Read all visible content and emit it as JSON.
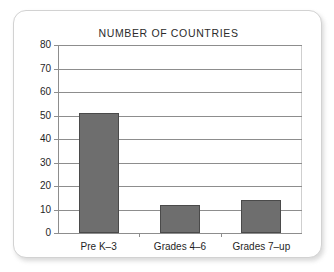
{
  "chart_data": {
    "type": "bar",
    "title": "NUMBER OF COUNTRIES",
    "xlabel": "",
    "ylabel": "",
    "categories": [
      "Pre K–3",
      "Grades 4–6",
      "Grades 7–up"
    ],
    "values": [
      51,
      12,
      14
    ],
    "ylim": [
      0,
      80
    ],
    "ytick_labels": [
      "80",
      "70",
      "60",
      "50",
      "40",
      "30",
      "20",
      "10",
      "0"
    ],
    "ytick_values": [
      80,
      70,
      60,
      50,
      40,
      30,
      20,
      10,
      0
    ],
    "ytick_interval": 10,
    "grid": "horizontal",
    "legend": "none",
    "bar_color": "#6e6e6e",
    "bar_edge_color": "#4a4a4a",
    "axis_color": "#8d8d8d",
    "background_color": "#ffffff"
  }
}
